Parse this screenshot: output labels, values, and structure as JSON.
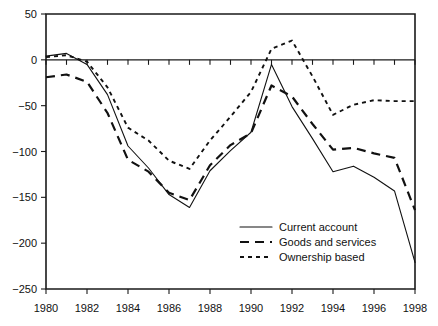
{
  "chart_data": {
    "type": "line",
    "title": "",
    "xlabel": "",
    "ylabel": "",
    "xlim": [
      1980,
      1998
    ],
    "ylim": [
      -250,
      50
    ],
    "yticks": [
      50,
      0,
      -50,
      -100,
      -150,
      -200,
      -250
    ],
    "ytick_labels": [
      "50",
      "0",
      "−50",
      "−100",
      "−150",
      "−200",
      "−250"
    ],
    "xticks": [
      1980,
      1982,
      1984,
      1986,
      1988,
      1990,
      1992,
      1994,
      1996,
      1998
    ],
    "xtick_labels": [
      "1980",
      "1982",
      "1984",
      "1986",
      "1988",
      "1990",
      "1992",
      "1994",
      "1996",
      "1998"
    ],
    "x_minor_ticks": [
      1981,
      1983,
      1985,
      1987,
      1989,
      1991,
      1993,
      1995,
      1997
    ],
    "grid": false,
    "legend_position": "lower-right",
    "x": [
      1980,
      1981,
      1982,
      1983,
      1984,
      1985,
      1986,
      1987,
      1988,
      1989,
      1990,
      1991,
      1992,
      1993,
      1994,
      1995,
      1996,
      1997,
      1998
    ],
    "series": [
      {
        "name": "Current account",
        "style": "solid",
        "values": [
          4,
          7,
          -5,
          -38,
          -94,
          -118,
          -147,
          -161,
          -121,
          -99,
          -79,
          -5,
          -51,
          -86,
          -122,
          -116,
          -128,
          -143,
          -221
        ]
      },
      {
        "name": "Goods and services",
        "style": "dashed",
        "values": [
          -19,
          -16,
          -24,
          -58,
          -109,
          -122,
          -145,
          -153,
          -115,
          -93,
          -80,
          -28,
          -40,
          -70,
          -98,
          -96,
          -102,
          -107,
          -164
        ]
      },
      {
        "name": "Ownership based",
        "style": "dotted",
        "values": [
          3,
          5,
          -2,
          -30,
          -74,
          -88,
          -110,
          -119,
          -88,
          -62,
          -35,
          12,
          21,
          -18,
          -60,
          -49,
          -44,
          -45,
          -45
        ]
      }
    ],
    "legend": [
      {
        "label": "Current account",
        "style": "solid"
      },
      {
        "label": "Goods and services",
        "style": "dashed"
      },
      {
        "label": "Ownership based",
        "style": "dotted"
      }
    ],
    "colors": {
      "axis": "#1a1a1a",
      "series": "#111111",
      "background": "#ffffff"
    }
  }
}
